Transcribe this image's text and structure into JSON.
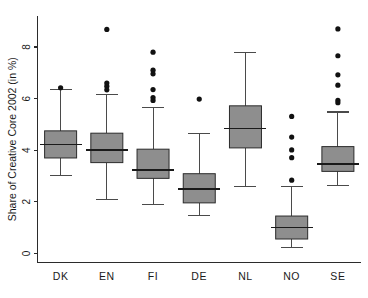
{
  "figure": {
    "width": 368,
    "height": 298,
    "background": "#ffffff",
    "box_fill": "#8e8e8e",
    "line_color": "#2b2b2b",
    "outlier_color": "#111111"
  },
  "chart_data": {
    "type": "box",
    "title": "",
    "subtitle": "",
    "xlabel": "",
    "ylabel": "Share of Creative Core 2002 (in %)",
    "categories": [
      "DK",
      "EN",
      "FI",
      "DE",
      "NL",
      "NO",
      "SE"
    ],
    "ylim": [
      -0.35,
      9.2
    ],
    "yticks": [
      0,
      2,
      4,
      6,
      8
    ],
    "ytick_labels": [
      "0",
      "2",
      "4",
      "6",
      "8"
    ],
    "grid": false,
    "legend": null,
    "boxes": [
      {
        "label": "DK",
        "whisker_low": 3.02,
        "q1": 3.7,
        "median": 4.22,
        "q3": 4.75,
        "whisker_high": 6.35,
        "outliers": [
          6.42
        ]
      },
      {
        "label": "EN",
        "whisker_low": 2.09,
        "q1": 3.52,
        "median": 4.01,
        "q3": 4.66,
        "whisker_high": 6.17,
        "outliers": [
          8.68,
          6.6,
          6.48,
          6.34
        ]
      },
      {
        "label": "FI",
        "whisker_low": 1.9,
        "q1": 2.91,
        "median": 3.24,
        "q3": 4.04,
        "whisker_high": 5.64,
        "outliers": [
          7.8,
          7.1,
          6.96,
          6.35,
          6.04,
          5.93
        ]
      },
      {
        "label": "DE",
        "whisker_low": 1.48,
        "q1": 1.96,
        "median": 2.5,
        "q3": 3.09,
        "whisker_high": 4.66,
        "outliers": [
          5.98
        ]
      },
      {
        "label": "NL",
        "whisker_low": 2.6,
        "q1": 4.09,
        "median": 4.84,
        "q3": 5.72,
        "whisker_high": 7.8,
        "outliers": []
      },
      {
        "label": "NO",
        "whisker_low": 0.22,
        "q1": 0.56,
        "median": 1.0,
        "q3": 1.45,
        "whisker_high": 2.61,
        "outliers": [
          5.31,
          4.51,
          4.01,
          3.71,
          2.84
        ]
      },
      {
        "label": "SE",
        "whisker_low": 2.64,
        "q1": 3.18,
        "median": 3.46,
        "q3": 4.14,
        "whisker_high": 5.48,
        "outliers": [
          8.7,
          7.66,
          6.92,
          6.52,
          5.93,
          5.84
        ]
      }
    ]
  }
}
